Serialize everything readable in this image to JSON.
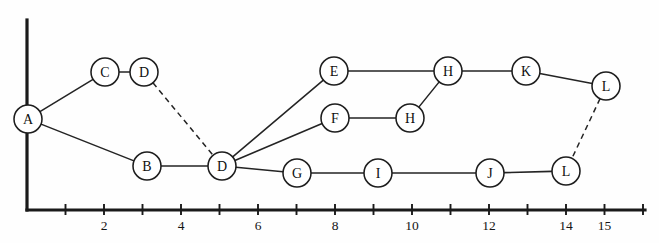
{
  "diagram": {
    "background_color": "#fefefe",
    "ink_color": "#1a1a1a",
    "node_radius": 14,
    "axis": {
      "name": "x-axis",
      "origin_px": 27,
      "unit_px": 38.5,
      "baseline_y_px": 210,
      "y_axis_top_px": 20,
      "y_axis_bottom_px": 210,
      "x_axis_end_px": 645,
      "tick_values": [
        1,
        2,
        3,
        4,
        5,
        6,
        7,
        8,
        9,
        10,
        11,
        12,
        13,
        14,
        15,
        16
      ],
      "tick_labels": [
        {
          "value": 2,
          "text": "2"
        },
        {
          "value": 4,
          "text": "4"
        },
        {
          "value": 6,
          "text": "6"
        },
        {
          "value": 8,
          "text": "8"
        },
        {
          "value": 10,
          "text": "10"
        },
        {
          "value": 12,
          "text": "12"
        },
        {
          "value": 14,
          "text": "14"
        },
        {
          "value": 15,
          "text": "15"
        }
      ]
    },
    "nodes": [
      {
        "id": "A",
        "label": "A",
        "x": 28,
        "y": 119
      },
      {
        "id": "C",
        "label": "C",
        "x": 105,
        "y": 72
      },
      {
        "id": "D1",
        "label": "D",
        "x": 144,
        "y": 72
      },
      {
        "id": "B",
        "label": "B",
        "x": 147,
        "y": 166
      },
      {
        "id": "D2",
        "label": "D",
        "x": 222,
        "y": 166
      },
      {
        "id": "E",
        "label": "E",
        "x": 334,
        "y": 71
      },
      {
        "id": "F",
        "label": "F",
        "x": 335,
        "y": 118
      },
      {
        "id": "G",
        "label": "G",
        "x": 297,
        "y": 173
      },
      {
        "id": "H1",
        "label": "H",
        "x": 448,
        "y": 71
      },
      {
        "id": "H2",
        "label": "H",
        "x": 410,
        "y": 118
      },
      {
        "id": "I",
        "label": "I",
        "x": 378,
        "y": 173
      },
      {
        "id": "K",
        "label": "K",
        "x": 526,
        "y": 71
      },
      {
        "id": "J",
        "label": "J",
        "x": 490,
        "y": 173
      },
      {
        "id": "L1",
        "label": "L",
        "x": 606,
        "y": 86
      },
      {
        "id": "L2",
        "label": "L",
        "x": 566,
        "y": 171
      }
    ],
    "edges": [
      {
        "from": "A",
        "to": "C",
        "style": "solid"
      },
      {
        "from": "C",
        "to": "D1",
        "style": "solid"
      },
      {
        "from": "D1",
        "to": "D2",
        "style": "dashed"
      },
      {
        "from": "A",
        "to": "B",
        "style": "solid"
      },
      {
        "from": "B",
        "to": "D2",
        "style": "solid"
      },
      {
        "from": "D2",
        "to": "E",
        "style": "solid"
      },
      {
        "from": "D2",
        "to": "F",
        "style": "solid"
      },
      {
        "from": "D2",
        "to": "G",
        "style": "solid"
      },
      {
        "from": "E",
        "to": "H1",
        "style": "solid"
      },
      {
        "from": "F",
        "to": "H2",
        "style": "solid"
      },
      {
        "from": "H2",
        "to": "H1",
        "style": "solid"
      },
      {
        "from": "H1",
        "to": "K",
        "style": "solid"
      },
      {
        "from": "K",
        "to": "L1",
        "style": "solid"
      },
      {
        "from": "L1",
        "to": "L2",
        "style": "dashed"
      },
      {
        "from": "G",
        "to": "I",
        "style": "solid"
      },
      {
        "from": "I",
        "to": "J",
        "style": "solid"
      },
      {
        "from": "J",
        "to": "L2",
        "style": "solid"
      }
    ]
  }
}
